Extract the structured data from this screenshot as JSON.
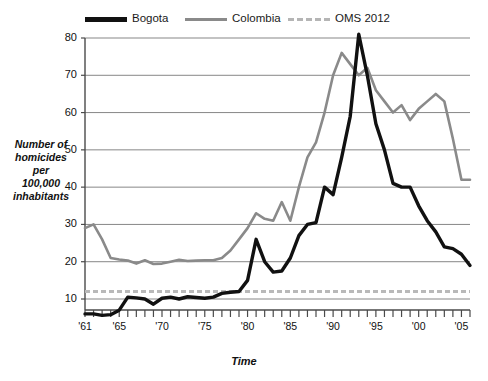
{
  "legend": {
    "items": [
      {
        "label": "Bogota",
        "style": "solid-thick-black",
        "color": "#111111"
      },
      {
        "label": "Colombia",
        "style": "solid-gray",
        "color": "#8a8a8a"
      },
      {
        "label": "OMS 2012",
        "style": "dashed-gray",
        "color": "#b5b5b5"
      }
    ]
  },
  "axes": {
    "ylabel_lines": [
      "Number of",
      "homicides",
      "per",
      "100,000",
      "inhabitants"
    ],
    "xlabel": "Time",
    "yticks": [
      "10",
      "20",
      "30",
      "40",
      "50",
      "60",
      "70",
      "80"
    ],
    "xticks": [
      "'61",
      "'65",
      "'70",
      "'75",
      "'80",
      "'85",
      "'90",
      "'95",
      "'00",
      "'05"
    ]
  },
  "chart_data": {
    "type": "line",
    "title": "",
    "xlabel": "Time",
    "ylabel": "Number of homicides per 100,000 inhabitants",
    "xlim": [
      1961,
      2006
    ],
    "ylim": [
      0,
      82
    ],
    "ytick_values": [
      10,
      20,
      30,
      40,
      50,
      60,
      70,
      80
    ],
    "xtick_values": [
      1961,
      1965,
      1970,
      1975,
      1980,
      1985,
      1990,
      1995,
      2000,
      2005
    ],
    "grid": "horizontal",
    "legend_position": "top",
    "x": [
      1961,
      1962,
      1963,
      1964,
      1965,
      1966,
      1967,
      1968,
      1969,
      1970,
      1971,
      1972,
      1973,
      1974,
      1975,
      1976,
      1977,
      1978,
      1979,
      1980,
      1981,
      1982,
      1983,
      1984,
      1985,
      1986,
      1987,
      1988,
      1989,
      1990,
      1991,
      1992,
      1993,
      1994,
      1995,
      1996,
      1997,
      1998,
      1999,
      2000,
      2001,
      2002,
      2003,
      2004,
      2005,
      2006
    ],
    "series": [
      {
        "name": "Bogota",
        "color": "#111111",
        "values": [
          6,
          6,
          5.6,
          5.8,
          7,
          10.5,
          10.3,
          10,
          8.6,
          10.2,
          10.5,
          10,
          10.6,
          10.4,
          10.2,
          10.5,
          11.5,
          11.8,
          12,
          15,
          26,
          20,
          17.2,
          17.5,
          21,
          27,
          30,
          30.5,
          40,
          38,
          48,
          59,
          81,
          70,
          57,
          50,
          41,
          40,
          40,
          35,
          31,
          28,
          24,
          23.5,
          22,
          19
        ]
      },
      {
        "name": "Colombia",
        "color": "#8a8a8a",
        "values": [
          29,
          30,
          26,
          21,
          20.6,
          20.3,
          19.5,
          20.4,
          19.4,
          19.5,
          20,
          20.5,
          20.2,
          20.3,
          20.4,
          20.4,
          21,
          23,
          26,
          29,
          33,
          31.5,
          31,
          36,
          31,
          40,
          48,
          52,
          60,
          70,
          76,
          73,
          70,
          72,
          66,
          63,
          60,
          62,
          58,
          61,
          63,
          65,
          63,
          53,
          42,
          42
        ]
      },
      {
        "name": "OMS 2012",
        "color": "#b5b5b5",
        "style": "dashed",
        "constant_value": 12
      }
    ]
  },
  "plot_geometry": {
    "left": 85,
    "right": 470,
    "top": 38,
    "bottom": 310,
    "y_at_80": 38,
    "y_at_10": 299
  }
}
